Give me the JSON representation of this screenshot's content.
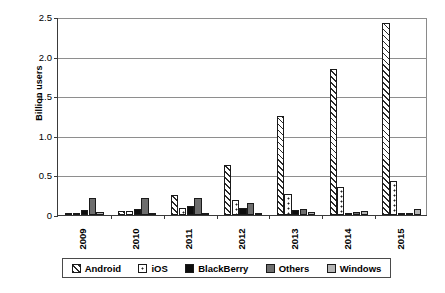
{
  "chart_data": {
    "type": "bar",
    "title": "",
    "subtitle": "",
    "xlabel": "",
    "ylabel": "Billion users",
    "categories": [
      "2009",
      "2010",
      "2011",
      "2012",
      "2013",
      "2014",
      "2015"
    ],
    "ylim": [
      0,
      2.5
    ],
    "yticks": [
      "0",
      "0.5",
      "1.0",
      "1.5",
      "2.0",
      "2.5"
    ],
    "ytick_values": [
      0,
      0.5,
      1.0,
      1.5,
      2.0,
      2.5
    ],
    "grid": true,
    "legend_position": "bottom",
    "series": [
      {
        "name": "Android",
        "pattern": "diagonal-hatch",
        "values": [
          0.01,
          0.05,
          0.25,
          0.63,
          1.25,
          1.84,
          2.42
        ]
      },
      {
        "name": "iOS",
        "pattern": "dotted",
        "values": [
          0.03,
          0.05,
          0.09,
          0.19,
          0.27,
          0.35,
          0.43
        ]
      },
      {
        "name": "BlackBerry",
        "pattern": "solid-black",
        "values": [
          0.06,
          0.07,
          0.11,
          0.09,
          0.06,
          0.02,
          0.01
        ]
      },
      {
        "name": "Others",
        "pattern": "solid-dark-gray",
        "values": [
          0.21,
          0.22,
          0.22,
          0.15,
          0.08,
          0.04,
          0.02
        ]
      },
      {
        "name": "Windows",
        "pattern": "solid-light-gray",
        "values": [
          0.04,
          0.03,
          0.01,
          0.02,
          0.04,
          0.05,
          0.07
        ]
      }
    ]
  },
  "colors": {
    "android": "#ffffff",
    "ios": "#ffffff",
    "blackberry": "#0d0d0d",
    "others": "#6e6e6e",
    "windows": "#b4b4b4",
    "axis": "#3a3a3a",
    "gridline": "#8e8e8e",
    "background": "#ffffff"
  }
}
